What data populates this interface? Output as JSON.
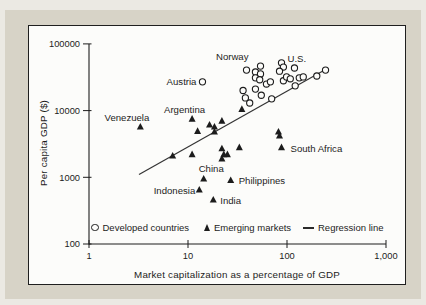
{
  "chart_data": {
    "type": "scatter",
    "xlabel": "Market capitalization as a percentage of GDP",
    "ylabel": "Per capita GDP ($)",
    "x_scale": "log",
    "y_scale": "log",
    "xlim": [
      1,
      1000
    ],
    "ylim": [
      100,
      100000
    ],
    "grid": false,
    "x_tick_labels": [
      "1",
      "10",
      "100",
      "1,000"
    ],
    "y_tick_labels": [
      "100",
      "1000",
      "10000",
      "100000"
    ],
    "legend": [
      {
        "marker": "circle",
        "label": "Developed countries"
      },
      {
        "marker": "triangle",
        "label": "Emerging markets"
      },
      {
        "marker": "line",
        "label": "Regression line"
      }
    ],
    "series": [
      {
        "name": "Developed countries",
        "marker": "circle",
        "points": [
          {
            "x": 14,
            "y": 27000,
            "label": "Austria"
          },
          {
            "x": 39,
            "y": 40500,
            "label": "Norway"
          },
          {
            "x": 36,
            "y": 20000
          },
          {
            "x": 38,
            "y": 15500
          },
          {
            "x": 42,
            "y": 13000
          },
          {
            "x": 48,
            "y": 21000
          },
          {
            "x": 55,
            "y": 17000
          },
          {
            "x": 54,
            "y": 46500
          },
          {
            "x": 48,
            "y": 38000
          },
          {
            "x": 54,
            "y": 35500
          },
          {
            "x": 48,
            "y": 31000
          },
          {
            "x": 53,
            "y": 29000
          },
          {
            "x": 62,
            "y": 25000
          },
          {
            "x": 68,
            "y": 27000
          },
          {
            "x": 88,
            "y": 52000
          },
          {
            "x": 92,
            "y": 45000
          },
          {
            "x": 84,
            "y": 39000
          },
          {
            "x": 70,
            "y": 15000
          },
          {
            "x": 92,
            "y": 28000
          },
          {
            "x": 99,
            "y": 32000
          },
          {
            "x": 108,
            "y": 30000
          },
          {
            "x": 119,
            "y": 43500,
            "label": "U.S."
          },
          {
            "x": 121,
            "y": 23500
          },
          {
            "x": 133,
            "y": 31000
          },
          {
            "x": 146,
            "y": 32000
          },
          {
            "x": 200,
            "y": 33000
          },
          {
            "x": 245,
            "y": 40500
          }
        ]
      },
      {
        "name": "Emerging markets",
        "marker": "triangle",
        "points": [
          {
            "x": 3.3,
            "y": 5700,
            "label": "Venezuela"
          },
          {
            "x": 11,
            "y": 7500,
            "label": "Argentina"
          },
          {
            "x": 12.5,
            "y": 4900
          },
          {
            "x": 16.5,
            "y": 6100
          },
          {
            "x": 18.5,
            "y": 5700
          },
          {
            "x": 18.5,
            "y": 4800
          },
          {
            "x": 22,
            "y": 7000
          },
          {
            "x": 35,
            "y": 10500
          },
          {
            "x": 33,
            "y": 2800
          },
          {
            "x": 22,
            "y": 2700
          },
          {
            "x": 23,
            "y": 2200
          },
          {
            "x": 22,
            "y": 1900
          },
          {
            "x": 25,
            "y": 2200
          },
          {
            "x": 7,
            "y": 2100
          },
          {
            "x": 11,
            "y": 2200
          },
          {
            "x": 14.4,
            "y": 950,
            "label": "China"
          },
          {
            "x": 13,
            "y": 650,
            "label": "Indonesia"
          },
          {
            "x": 27,
            "y": 900,
            "label": "Philippines"
          },
          {
            "x": 18,
            "y": 460,
            "label": "India"
          },
          {
            "x": 88,
            "y": 2800,
            "label": "South Africa"
          },
          {
            "x": 82,
            "y": 4800
          },
          {
            "x": 84,
            "y": 4200
          }
        ]
      }
    ],
    "regression_line": {
      "x1": 3.2,
      "y1": 1100,
      "x2": 250,
      "y2": 42000
    },
    "annotations": [
      {
        "text": "Norway",
        "x": 39,
        "y": 40500,
        "dx": 2,
        "dy": -10,
        "anchor": "end"
      },
      {
        "text": "U.S.",
        "x": 119,
        "y": 43500,
        "dx": -7,
        "dy": -6,
        "anchor": "start"
      },
      {
        "text": "Austria",
        "x": 14,
        "y": 27000,
        "dx": -6,
        "dy": 3,
        "anchor": "end"
      },
      {
        "text": "Venezuela",
        "x": 3.3,
        "y": 5700,
        "dx": 9,
        "dy": -6,
        "anchor": "end"
      },
      {
        "text": "Argentina",
        "x": 11,
        "y": 7500,
        "dx": 13,
        "dy": -6,
        "anchor": "end"
      },
      {
        "text": "China",
        "x": 14.4,
        "y": 950,
        "dx": -5,
        "dy": -7,
        "anchor": "start"
      },
      {
        "text": "Indonesia",
        "x": 13,
        "y": 650,
        "dx": -4,
        "dy": 4,
        "anchor": "end"
      },
      {
        "text": "Philippines",
        "x": 27,
        "y": 900,
        "dx": 8,
        "dy": 4,
        "anchor": "start"
      },
      {
        "text": "India",
        "x": 18,
        "y": 460,
        "dx": 7,
        "dy": 4,
        "anchor": "start"
      },
      {
        "text": "South Africa",
        "x": 88,
        "y": 2800,
        "dx": 9,
        "dy": 5,
        "anchor": "start"
      }
    ],
    "colors": {
      "ink": "#1c1c1c",
      "regression_line": "#333333",
      "chart_background": "#fcfcfa",
      "panel_background": "#d7d3c7",
      "page_background": "#ebe9e3"
    }
  }
}
